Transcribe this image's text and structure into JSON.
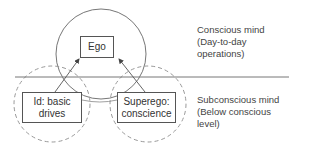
{
  "diagram": {
    "title": "",
    "nodes": {
      "ego": {
        "label": "Ego"
      },
      "id": {
        "label_line1": "Id: basic",
        "label_line2": "drives"
      },
      "superego": {
        "label_line1": "Superego:",
        "label_line2": "conscience"
      }
    },
    "regions": {
      "conscious": {
        "line1": "Conscious mind",
        "line2": "(Day-to-day",
        "line3": "operations)"
      },
      "subconscious": {
        "line1": "Subconscious mind",
        "line2": "(Below conscious",
        "line3": "level)"
      }
    },
    "edges": [
      {
        "from": "id",
        "to": "ego",
        "style": "arrow"
      },
      {
        "from": "superego",
        "to": "ego",
        "style": "arrow"
      },
      {
        "from": "id",
        "to": "superego",
        "style": "curve"
      }
    ],
    "colors": {
      "line": "#666666",
      "dashed": "#999999",
      "text": "#333333"
    }
  }
}
